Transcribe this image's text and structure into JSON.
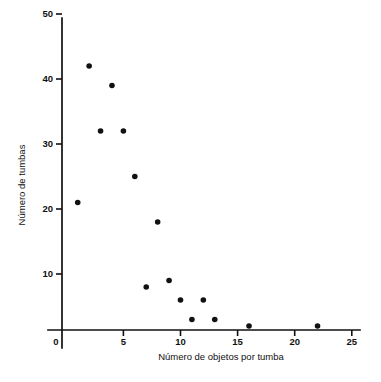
{
  "chart_data": {
    "type": "scatter",
    "title": "",
    "subtitle": "",
    "xlabel": "Número de objetos por tumba",
    "ylabel": "Número de tumbas",
    "xlim": [
      0,
      25
    ],
    "ylim": [
      0,
      52
    ],
    "grid": false,
    "legend": null,
    "xticks": [
      0,
      5,
      10,
      15,
      20,
      25
    ],
    "xtick_labels": [
      "0",
      "5",
      "10",
      "15",
      "20",
      "25"
    ],
    "yticks": [
      10,
      20,
      30,
      40,
      50
    ],
    "ytick_labels": [
      "10",
      "20",
      "30",
      "40",
      "50"
    ],
    "marker": "filled-circle",
    "marker_color": "#111111",
    "series": [
      {
        "name": "tumbas",
        "points": [
          {
            "x": 1,
            "y": 21
          },
          {
            "x": 2,
            "y": 42
          },
          {
            "x": 3,
            "y": 32
          },
          {
            "x": 4,
            "y": 39
          },
          {
            "x": 5,
            "y": 32
          },
          {
            "x": 6,
            "y": 25
          },
          {
            "x": 7,
            "y": 8
          },
          {
            "x": 8,
            "y": 18
          },
          {
            "x": 9,
            "y": 9
          },
          {
            "x": 10,
            "y": 6
          },
          {
            "x": 11,
            "y": 3
          },
          {
            "x": 12,
            "y": 6
          },
          {
            "x": 13,
            "y": 3
          },
          {
            "x": 16,
            "y": 2
          },
          {
            "x": 22,
            "y": 2
          }
        ]
      }
    ]
  },
  "figure": {
    "background_color": "#ffffff",
    "foreground_color": "#111111"
  }
}
